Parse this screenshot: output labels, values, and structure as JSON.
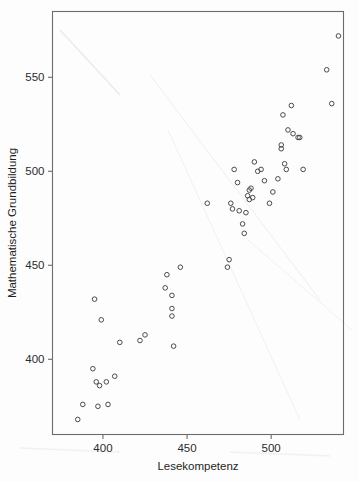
{
  "figure": {
    "kind": "scatterplot",
    "background_color": "#fdfdfe",
    "frame_color": "#6b6b70",
    "marker_color": "#4a4a50",
    "marker_shape": "open-circle"
  },
  "axes": {
    "x_title": "Lesekompetenz",
    "y_title": "Mathematische Grundbildung",
    "x_ticks": [
      "400",
      "450",
      "500"
    ],
    "y_ticks": [
      "400",
      "450",
      "500",
      "550"
    ]
  },
  "chart_data": {
    "type": "scatter",
    "title": "",
    "subtitle": "",
    "xlabel": "Lesekompetenz",
    "ylabel": "Mathematische Grundbildung",
    "xlim": [
      370,
      543
    ],
    "ylim": [
      360,
      585
    ],
    "xticks": [
      400,
      450,
      500
    ],
    "yticks": [
      400,
      450,
      500,
      550
    ],
    "grid": false,
    "legend": null,
    "annotations": [],
    "series": [
      {
        "name": "Laender",
        "marker": "open-circle",
        "color": "#4a4a50",
        "points": [
          [
            385,
            368
          ],
          [
            388,
            376
          ],
          [
            394,
            395
          ],
          [
            395,
            432
          ],
          [
            396,
            388
          ],
          [
            397,
            375
          ],
          [
            398,
            386
          ],
          [
            399,
            421
          ],
          [
            402,
            388
          ],
          [
            403,
            376
          ],
          [
            407,
            391
          ],
          [
            410,
            409
          ],
          [
            422,
            410
          ],
          [
            425,
            413
          ],
          [
            437,
            438
          ],
          [
            438,
            445
          ],
          [
            441,
            427
          ],
          [
            441,
            423
          ],
          [
            441,
            434
          ],
          [
            442,
            407
          ],
          [
            446,
            449
          ],
          [
            462,
            483
          ],
          [
            474,
            449
          ],
          [
            475,
            453
          ],
          [
            476,
            483
          ],
          [
            477,
            480
          ],
          [
            478,
            501
          ],
          [
            480,
            494
          ],
          [
            481,
            479
          ],
          [
            483,
            472
          ],
          [
            484,
            467
          ],
          [
            485,
            478
          ],
          [
            486,
            487
          ],
          [
            487,
            485
          ],
          [
            487,
            490
          ],
          [
            488,
            491
          ],
          [
            489,
            486
          ],
          [
            490,
            505
          ],
          [
            492,
            500
          ],
          [
            494,
            501
          ],
          [
            496,
            495
          ],
          [
            499,
            483
          ],
          [
            501,
            489
          ],
          [
            504,
            496
          ],
          [
            506,
            512
          ],
          [
            506,
            514
          ],
          [
            507,
            530
          ],
          [
            508,
            504
          ],
          [
            509,
            501
          ],
          [
            510,
            522
          ],
          [
            512,
            535
          ],
          [
            513,
            520
          ],
          [
            516,
            518
          ],
          [
            517,
            518
          ],
          [
            519,
            501
          ],
          [
            533,
            554
          ],
          [
            536,
            536
          ],
          [
            540,
            572
          ]
        ]
      }
    ]
  }
}
